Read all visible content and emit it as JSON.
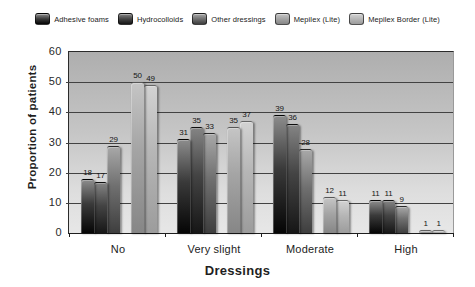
{
  "chart_data": {
    "type": "bar",
    "title": "",
    "xlabel": "Dressings",
    "ylabel": "Proportion of patients",
    "categories": [
      "No",
      "Very slight",
      "Moderate",
      "High"
    ],
    "series": [
      {
        "name": "Adhesive foams",
        "values": [
          18,
          31,
          39,
          11
        ],
        "colors": [
          "#8c8c8c",
          "#3a3a3a",
          "#050505"
        ]
      },
      {
        "name": "Hydrocolloids",
        "values": [
          17,
          35,
          36,
          11
        ],
        "colors": [
          "#848484",
          "#444444",
          "#161616"
        ]
      },
      {
        "name": "Other dressings",
        "values": [
          29,
          33,
          28,
          9
        ],
        "colors": [
          "#a8a8a8",
          "#707070",
          "#3e3e3e"
        ]
      },
      {
        "name": "Mepilex (Lite)",
        "values": [
          50,
          35,
          12,
          1
        ],
        "colors": [
          "#c5c5c5",
          "#a4a4a4",
          "#868686"
        ]
      },
      {
        "name": "Mepilex Border (Lite)",
        "values": [
          49,
          37,
          11,
          1
        ],
        "colors": [
          "#d2d2d2",
          "#b6b6b6",
          "#9c9c9c"
        ]
      }
    ],
    "ylim": [
      0,
      60
    ],
    "yticks": [
      0,
      10,
      20,
      30,
      40,
      50,
      60
    ],
    "grid": true,
    "grid_color": "#424242",
    "plot_background_top": "#aeaeae",
    "plot_background_bottom": "#e7e7e7",
    "legend_position": "top",
    "bar_value_labels_shown": true,
    "text_color": "#1f1f1f"
  }
}
